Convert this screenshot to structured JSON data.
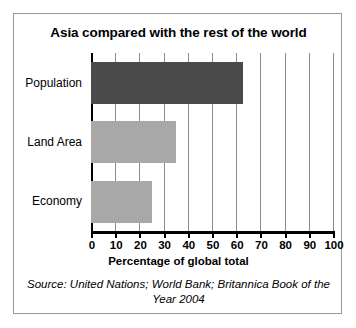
{
  "chart_data": {
    "type": "bar",
    "orientation": "horizontal",
    "title": "Asia compared with the rest of the world",
    "xlabel": "Percentage of global total",
    "ylabel": "",
    "categories": [
      "Population",
      "Land Area",
      "Economy"
    ],
    "values": [
      63,
      35,
      25
    ],
    "colors": [
      "#4a4a4a",
      "#a8a8a8",
      "#a8a8a8"
    ],
    "xlim": [
      0,
      100
    ],
    "xticks": [
      0,
      10,
      20,
      30,
      40,
      50,
      60,
      70,
      80,
      90,
      100
    ],
    "xtick_labels": [
      "0",
      "10",
      "20",
      "30",
      "40",
      "50",
      "60",
      "70",
      "80",
      "90",
      "100"
    ],
    "grid": true,
    "grid_axis": "x",
    "legend": false,
    "source_note": "Source: United Nations; World Bank; Britannica Book of the Year 2004"
  },
  "figure": {
    "title": "Asia compared with the rest of the world",
    "x_axis_title": "Percentage of global total",
    "source": "Source: United Nations; World Bank; Britannica Book of the Year 2004"
  }
}
